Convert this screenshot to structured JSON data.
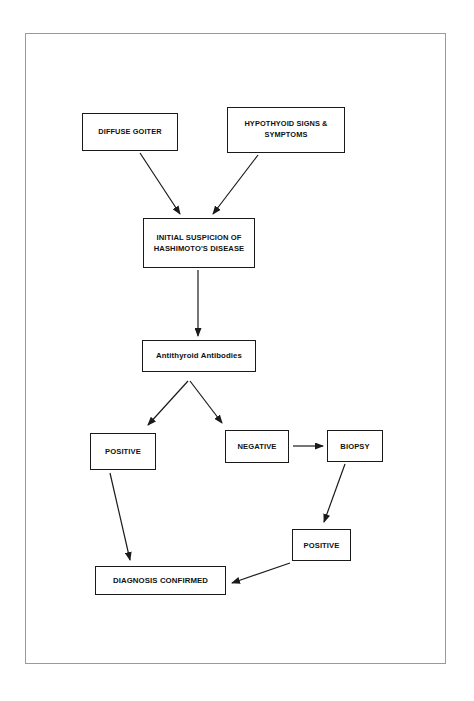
{
  "diagram": {
    "type": "flowchart",
    "orientation": "top-down",
    "colors": {
      "node_border": "#1a1a1a",
      "node_fill": "#ffffff",
      "edge": "#1a1a1a",
      "page_border": "#9a9a9a",
      "background": "#ffffff",
      "text": "#111111"
    },
    "nodes": [
      {
        "id": "diffuse_goiter",
        "label": "DIFFUSE GOITER",
        "shape": "rectangle",
        "x": 82,
        "y": 113,
        "w": 96,
        "h": 38
      },
      {
        "id": "hypothyroid_signs",
        "label": "HYPOTHYOID SIGNS & SYMPTOMS",
        "line1": "HYPOTHYOID SIGNS &",
        "line2": "SYMPTOMS",
        "shape": "rectangle",
        "x": 227,
        "y": 107,
        "w": 118,
        "h": 46
      },
      {
        "id": "initial_suspicion",
        "label": "INITIAL SUSPICION OF HASHIMOTO'S DISEASE",
        "line1": "INITIAL SUSPICION OF",
        "line2": "HASHIMOTO'S DISEASE",
        "shape": "rectangle",
        "x": 143,
        "y": 218,
        "w": 112,
        "h": 50
      },
      {
        "id": "antithyroid_antibodies",
        "label": "Antithyroid Antibodies",
        "shape": "rectangle",
        "x": 142,
        "y": 340,
        "w": 114,
        "h": 32
      },
      {
        "id": "positive_left",
        "label": "POSITIVE",
        "shape": "rectangle",
        "x": 90,
        "y": 433,
        "w": 66,
        "h": 37
      },
      {
        "id": "negative",
        "label": "NEGATIVE",
        "shape": "rectangle",
        "x": 225,
        "y": 430,
        "w": 64,
        "h": 33
      },
      {
        "id": "biopsy",
        "label": "BIOPSY",
        "shape": "rectangle",
        "x": 327,
        "y": 430,
        "w": 56,
        "h": 32
      },
      {
        "id": "positive_lower",
        "label": "POSITIVE",
        "shape": "rectangle",
        "x": 292,
        "y": 529,
        "w": 59,
        "h": 32
      },
      {
        "id": "diagnosis_confirmed",
        "label": "DIAGNOSIS CONFIRMED",
        "shape": "rectangle",
        "x": 95,
        "y": 566,
        "w": 131,
        "h": 29
      }
    ],
    "edges": [
      {
        "id": "e1",
        "from": "diffuse_goiter",
        "to": "initial_suspicion",
        "style": "diagonal-arrow"
      },
      {
        "id": "e2",
        "from": "hypothyroid_signs",
        "to": "initial_suspicion",
        "style": "diagonal-arrow"
      },
      {
        "id": "e3",
        "from": "initial_suspicion",
        "to": "antithyroid_antibodies",
        "style": "vertical-arrow"
      },
      {
        "id": "e4",
        "from": "antithyroid_antibodies",
        "to": "positive_left",
        "style": "branch-arrow"
      },
      {
        "id": "e5",
        "from": "antithyroid_antibodies",
        "to": "negative",
        "style": "branch-arrow"
      },
      {
        "id": "e6",
        "from": "negative",
        "to": "biopsy",
        "style": "horizontal-arrow"
      },
      {
        "id": "e7",
        "from": "biopsy",
        "to": "positive_lower",
        "style": "diagonal-arrow"
      },
      {
        "id": "e8",
        "from": "positive_left",
        "to": "diagnosis_confirmed",
        "style": "diagonal-arrow"
      },
      {
        "id": "e9",
        "from": "positive_lower",
        "to": "diagnosis_confirmed",
        "style": "diagonal-arrow"
      }
    ]
  }
}
